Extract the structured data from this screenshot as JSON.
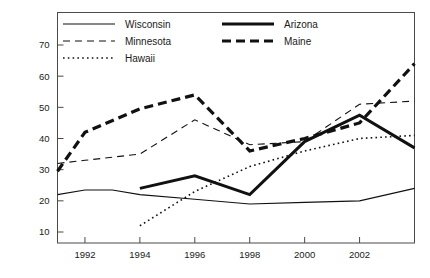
{
  "chart_data": {
    "type": "line",
    "title": "",
    "xlabel": "",
    "ylabel": "",
    "xlim": [
      1991,
      2004
    ],
    "ylim": [
      5,
      75
    ],
    "grid": false,
    "legend_position": "top-center-inside",
    "xticks": [
      1992,
      1994,
      1996,
      1998,
      2000,
      2002
    ],
    "xtick_labels": [
      "1992",
      "1994",
      "1996",
      "1998",
      "2000",
      "2002"
    ],
    "yticks": [
      10,
      20,
      30,
      40,
      50,
      60,
      70
    ],
    "ytick_labels": [
      "10",
      "20",
      "30",
      "40",
      "50",
      "60",
      "70"
    ],
    "x": [
      1991,
      1992,
      1993,
      1994,
      1995,
      1996,
      1997,
      1998,
      1999,
      2000,
      2001,
      2002,
      2003,
      2004
    ],
    "series": [
      {
        "name": "Wisconsin",
        "style": "solid-thin",
        "x": [
          1991,
          1992,
          1993,
          1994,
          1996,
          1998,
          2000,
          2002,
          2004
        ],
        "values": [
          22,
          23.5,
          23.5,
          22,
          20.5,
          19,
          19.5,
          20,
          24
        ]
      },
      {
        "name": "Minnesota",
        "style": "dashed-thin",
        "x": [
          1991,
          1992,
          1994,
          1996,
          1998,
          2000,
          2002,
          2004
        ],
        "values": [
          32,
          33,
          35,
          46,
          38,
          39,
          51,
          52
        ]
      },
      {
        "name": "Hawaii",
        "style": "dotted-thin",
        "x": [
          1994,
          1996,
          1998,
          2000,
          2002,
          2004
        ],
        "values": [
          12,
          23,
          31,
          36,
          40,
          41
        ]
      },
      {
        "name": "Arizona",
        "style": "solid-thick",
        "x": [
          1994,
          1996,
          1998,
          2000,
          2002,
          2004
        ],
        "values": [
          24,
          28,
          22,
          39,
          47.5,
          37
        ]
      },
      {
        "name": "Maine",
        "style": "dashed-thick",
        "x": [
          1991,
          1992,
          1994,
          1996,
          1998,
          2000,
          2002,
          2004
        ],
        "values": [
          29.5,
          42,
          49.5,
          54,
          36,
          40,
          45,
          64
        ]
      }
    ]
  },
  "legend": {
    "entries": [
      {
        "label": "Wisconsin",
        "style": "solid-thin"
      },
      {
        "label": "Minnesota",
        "style": "dashed-thin"
      },
      {
        "label": "Hawaii",
        "style": "dotted-thin"
      },
      {
        "label": "Arizona",
        "style": "solid-thick"
      },
      {
        "label": "Maine",
        "style": "dashed-thick"
      }
    ]
  },
  "colors": {
    "line": "#111111",
    "axis": "#4a4a4a",
    "background": "#ffffff",
    "text": "#1a1a1a"
  }
}
